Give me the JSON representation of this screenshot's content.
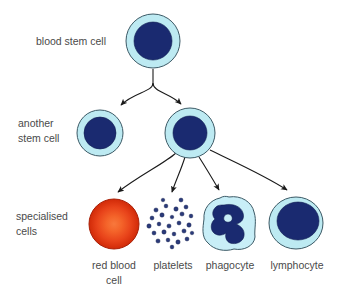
{
  "diagram": {
    "rows": [
      {
        "id": "row-1",
        "label": "blood stem cell",
        "label_lines": [
          "blood stem cell"
        ]
      },
      {
        "id": "row-2",
        "label": "another stem cell",
        "label_lines": [
          "another",
          "stem cell"
        ]
      },
      {
        "id": "row-3",
        "label": "specialised cells",
        "label_lines": [
          "specialised",
          "cells"
        ]
      }
    ],
    "cells": [
      {
        "id": "blood-stem-cell",
        "name": "blood stem cell",
        "type": "stem-cell",
        "cx": 153,
        "cy": 41,
        "rx": 27,
        "ry": 27,
        "nucleus_rx": 19,
        "nucleus_ry": 19,
        "cytoplasm_color": "#bdeaf2",
        "nucleus_color": "#1a2a70"
      },
      {
        "id": "another-stem-cell",
        "name": "another stem cell",
        "type": "stem-cell",
        "cx": 100,
        "cy": 133,
        "rx": 23,
        "ry": 23,
        "nucleus_rx": 16,
        "nucleus_ry": 16,
        "cytoplasm_color": "#bdeaf2",
        "nucleus_color": "#1a2a70"
      },
      {
        "id": "dividing-stem-cell",
        "name": "dividing stem cell",
        "type": "stem-cell",
        "cx": 190,
        "cy": 133,
        "rx": 25,
        "ry": 25,
        "nucleus_rx": 17,
        "nucleus_ry": 17,
        "cytoplasm_color": "#bdeaf2",
        "nucleus_color": "#1a2a70"
      },
      {
        "id": "red-blood-cell",
        "name": "red blood cell",
        "type": "erythrocyte",
        "label": "red blood cell",
        "label_lines": [
          "red blood",
          "cell"
        ],
        "cx": 114,
        "cy": 224,
        "rx": 25,
        "ry": 25,
        "center_color": "#f4642a",
        "edge_color": "#d42a08",
        "outline_color": "#a81f06"
      },
      {
        "id": "platelets",
        "name": "platelets",
        "type": "platelets",
        "label": "platelets",
        "label_lines": [
          "platelets"
        ],
        "cx": 173,
        "cy": 224,
        "dot_color": "#2a3a7a",
        "dot_count": 26
      },
      {
        "id": "phagocyte",
        "name": "phagocyte",
        "type": "phagocyte",
        "label": "phagocyte",
        "label_lines": [
          "phagocyte"
        ],
        "cx": 229,
        "cy": 223,
        "rx": 26,
        "ry": 26,
        "cytoplasm_color": "#c8eef7",
        "nucleus_color": "#1a2a70"
      },
      {
        "id": "lymphocyte",
        "name": "lymphocyte",
        "type": "lymphocyte",
        "label": "lymphocyte",
        "label_lines": [
          "lymphocyte"
        ],
        "cx": 296,
        "cy": 223,
        "rx": 27,
        "ry": 26,
        "nucleus_rx": 21,
        "nucleus_ry": 19,
        "cytoplasm_color": "#bdeaf2",
        "nucleus_color": "#1a2a70"
      }
    ],
    "arrows": [
      {
        "id": "arrow-stem-to-another",
        "from": "blood-stem-cell",
        "to": "another-stem-cell"
      },
      {
        "id": "arrow-stem-to-dividing",
        "from": "blood-stem-cell",
        "to": "dividing-stem-cell"
      },
      {
        "id": "arrow-to-red-blood-cell",
        "from": "dividing-stem-cell",
        "to": "red-blood-cell"
      },
      {
        "id": "arrow-to-platelets",
        "from": "dividing-stem-cell",
        "to": "platelets"
      },
      {
        "id": "arrow-to-phagocyte",
        "from": "dividing-stem-cell",
        "to": "phagocyte"
      },
      {
        "id": "arrow-to-lymphocyte",
        "from": "dividing-stem-cell",
        "to": "lymphocyte"
      }
    ],
    "colors": {
      "cytoplasm": "#bdeaf2",
      "nucleus": "#1a2a70",
      "outline": "#3c5a66",
      "arrow": "#1a1a1a",
      "text": "#4a4a4a",
      "red_cell_center": "#f4642a",
      "red_cell_edge": "#d42a08",
      "background": "#ffffff"
    }
  }
}
